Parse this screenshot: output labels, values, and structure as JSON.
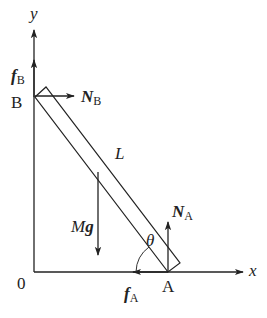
{
  "diagram": {
    "type": "free-body diagram",
    "colors": {
      "stroke": "#222222",
      "background": "#ffffff"
    },
    "axes": {
      "x_label": "x",
      "y_label": "y",
      "origin_label": "0"
    },
    "points": {
      "top": "B",
      "bottom": "A"
    },
    "rod": {
      "label": "L"
    },
    "angle": {
      "label": "θ"
    },
    "forces": {
      "weight": {
        "symbol": "Mg",
        "main": "M",
        "bold": "g",
        "direction": "down"
      },
      "normal_B": {
        "symbol": "N",
        "sub": "B",
        "direction": "right"
      },
      "friction_B": {
        "symbol": "f",
        "sub": "B",
        "direction": "up"
      },
      "normal_A": {
        "symbol": "N",
        "sub": "A",
        "direction": "up"
      },
      "friction_A": {
        "symbol": "f",
        "sub": "A",
        "direction": "left"
      }
    }
  }
}
